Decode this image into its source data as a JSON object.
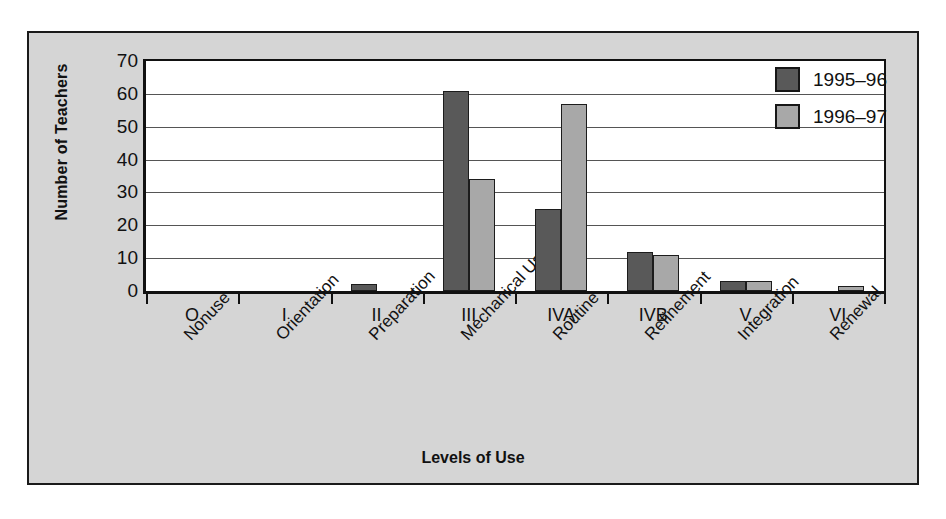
{
  "chart_data": {
    "type": "bar",
    "title": "",
    "xlabel": "Levels of Use",
    "ylabel": "Number of Teachers",
    "ylim": [
      0,
      70
    ],
    "ytick_step": 10,
    "yticks": [
      70,
      60,
      50,
      40,
      30,
      20,
      10,
      0
    ],
    "grid": true,
    "legend_position": "top-right",
    "categories": [
      "O",
      "I",
      "II",
      "III",
      "IVA",
      "IVB",
      "V",
      "VI"
    ],
    "category_names": [
      "Nonuse",
      "Orientation",
      "Preparation",
      "Mechanical Use",
      "Routine",
      "Refinement",
      "Integration",
      "Renewal"
    ],
    "series": [
      {
        "name": "1995–96",
        "color": "#595959",
        "values": [
          0,
          0,
          2,
          61,
          25,
          12,
          3,
          0
        ]
      },
      {
        "name": "1996–97",
        "color": "#a8a8a8",
        "values": [
          0,
          0,
          0,
          34,
          57,
          11,
          3,
          1.5
        ]
      }
    ]
  },
  "legend": {
    "items": [
      {
        "label": "1995–96",
        "color": "#595959"
      },
      {
        "label": "1996–97",
        "color": "#a8a8a8"
      }
    ]
  },
  "colors": {
    "panel_background": "#d5d5d5",
    "plot_background": "#ffffff",
    "axis": "#111111",
    "gridline": "#555555",
    "series_1995_96": "#595959",
    "series_1996_97": "#a8a8a8"
  }
}
